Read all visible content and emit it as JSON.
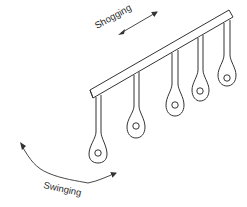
{
  "diagram": {
    "labels": {
      "shogging": "Shogging",
      "swinging": "Swinging"
    },
    "colors": {
      "stroke": "#333333",
      "background": "#ffffff"
    },
    "guide_bar": {
      "count": 1
    },
    "guides": [
      {
        "id": 1
      },
      {
        "id": 2
      },
      {
        "id": 3
      },
      {
        "id": 4
      },
      {
        "id": 5
      }
    ]
  }
}
